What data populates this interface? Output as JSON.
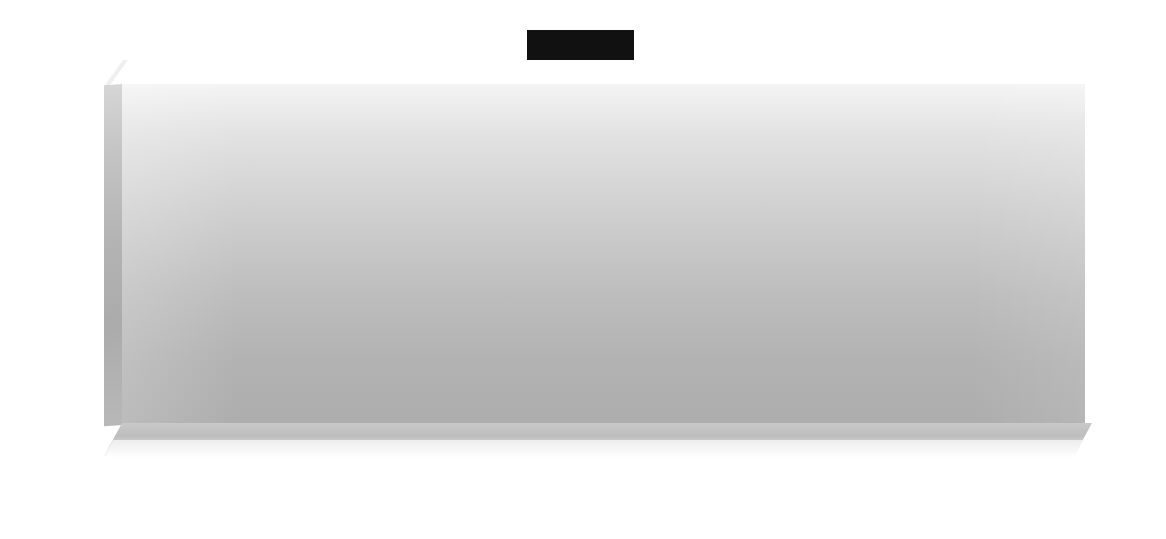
{
  "chart": {
    "y_axis_unit": "t/ha",
    "y_tick_labels": [
      "3",
      "2,5",
      "2",
      "1,5",
      "1"
    ],
    "x_tick_labels": [
      "1961",
      "1962",
      "1963",
      "1964",
      "1965",
      "1966",
      "1967",
      "1968",
      "1969",
      "1970",
      "1971",
      "1972",
      "1973",
      "1974",
      "1975",
      "1976",
      "1977",
      "1978",
      "1979",
      "1980",
      "1981",
      "1982",
      "1983",
      "1984",
      "1985",
      "1986",
      "1987",
      "1988",
      "1988",
      "1990",
      "1991"
    ],
    "colors": {
      "title_background": "#111111",
      "title_text": "#f2f2f2",
      "gridline": "#fdfdfd",
      "line_dark": "#3a3a3a",
      "line_shadow": "#6f6f6f",
      "plot_top": "#f4f4f4",
      "plot_bottom": "#adadad"
    }
  },
  "chart_data": {
    "type": "line",
    "xlabel": "",
    "ylabel": "t/ha",
    "ylim": [
      1,
      3
    ],
    "yticks": [
      1,
      1.5,
      2,
      2.5,
      3
    ],
    "grid": true,
    "legend": "none",
    "x": [
      1961,
      1962,
      1963,
      1964,
      1965,
      1966,
      1967,
      1968,
      1969,
      1970,
      1971,
      1972,
      1973,
      1974,
      1975,
      1976,
      1977,
      1978,
      1979,
      1980,
      1981,
      1982,
      1983,
      1984,
      1985,
      1986,
      1987,
      1988,
      1989,
      1990
    ],
    "values": [
      1.18,
      1.21,
      1.25,
      1.28,
      1.31,
      1.38,
      1.52,
      1.47,
      1.44,
      1.6,
      1.61,
      1.5,
      1.62,
      1.71,
      1.78,
      1.77,
      1.83,
      1.9,
      1.97,
      2.04,
      2.13,
      2.22,
      2.32,
      2.29,
      2.28,
      2.32,
      2.35,
      2.39,
      2.5,
      2.6
    ],
    "series": [
      {
        "name": "Mais",
        "values": [
          1.18,
          1.21,
          1.25,
          1.28,
          1.31,
          1.38,
          1.52,
          1.47,
          1.44,
          1.6,
          1.61,
          1.5,
          1.62,
          1.71,
          1.78,
          1.77,
          1.83,
          1.9,
          1.97,
          2.04,
          2.13,
          2.22,
          2.32,
          2.29,
          2.28,
          2.32,
          2.35,
          2.39,
          2.5,
          2.6
        ]
      }
    ],
    "annotations": []
  }
}
